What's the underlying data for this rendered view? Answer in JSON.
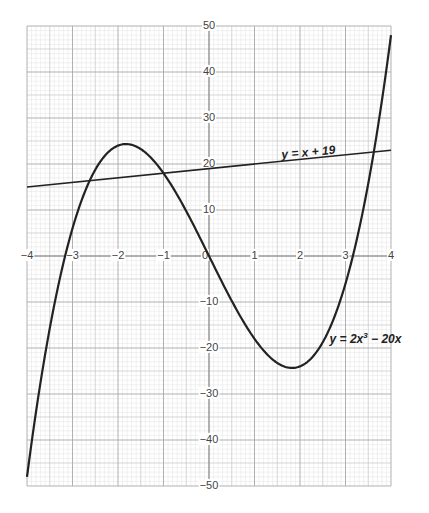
{
  "chart_data": {
    "type": "line",
    "title": "",
    "xlabel": "",
    "ylabel": "",
    "xlim": [
      -4,
      4
    ],
    "ylim": [
      -50,
      50
    ],
    "grid": true,
    "x_ticks": [
      -4,
      -3,
      -2,
      -1,
      0,
      1,
      2,
      3,
      4
    ],
    "x_tick_labels": [
      "−4",
      "−3",
      "−2",
      "−1",
      "0",
      "1",
      "2",
      "3",
      "4"
    ],
    "y_ticks": [
      50,
      40,
      30,
      20,
      10,
      -10,
      -20,
      -30,
      -40,
      -50
    ],
    "y_tick_labels": [
      "50",
      "40",
      "30",
      "20",
      "10",
      "−10",
      "−20",
      "−30",
      "−40",
      "−50"
    ],
    "series": [
      {
        "name": "y = 2x³ − 20x",
        "label_parts": [
          "y = 2x",
          "3",
          " − 20x"
        ],
        "function": "2*x^3 - 20*x",
        "x_range": [
          -4,
          4
        ],
        "x": [
          -4,
          -3.5,
          -3,
          -2.5,
          -2,
          -1.83,
          -1.5,
          -1,
          -0.5,
          0,
          0.5,
          1,
          1.5,
          1.83,
          2,
          2.5,
          3,
          3.5,
          4
        ],
        "values": [
          -48,
          -15.75,
          6,
          18.75,
          24,
          24.3,
          23.25,
          18,
          9.75,
          0,
          -9.75,
          -18,
          -23.25,
          -24.3,
          -24,
          -18.75,
          -6,
          15.75,
          48
        ],
        "label_anchor": {
          "x": 2.65,
          "y": -19
        }
      },
      {
        "name": "y = x + 19",
        "function": "x + 19",
        "x_range": [
          -4,
          4
        ],
        "x": [
          -4,
          4
        ],
        "values": [
          15,
          23
        ],
        "label_anchor": {
          "x": 1.6,
          "y": 21.2
        }
      }
    ],
    "colors": {
      "curve": "#222222",
      "major_grid": "#a8a8a8",
      "mid_grid": "#c4c4c4",
      "minor_grid": "#e2e2e2",
      "tick_text": "#444444"
    }
  }
}
